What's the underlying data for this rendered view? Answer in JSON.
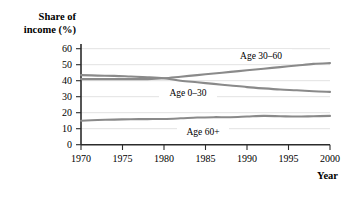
{
  "chart_data": {
    "type": "line",
    "title": "",
    "ylabel": "Share of income (%)",
    "ylabel_line1": "Share of",
    "ylabel_line2": "income (%)",
    "xlabel": "Year",
    "xlim": [
      1970,
      2000
    ],
    "ylim": [
      0,
      60
    ],
    "grid": true,
    "legend_position": "inline-labels",
    "x_ticks": [
      "1970",
      "1975",
      "1980",
      "1985",
      "1990",
      "1995",
      "2000"
    ],
    "x_tick_values": [
      1970,
      1975,
      1980,
      1985,
      1990,
      1995,
      2000
    ],
    "y_ticks": [
      "0",
      "10",
      "20",
      "30",
      "40",
      "50",
      "60"
    ],
    "y_tick_values": [
      0,
      10,
      20,
      30,
      40,
      50,
      60
    ],
    "x": [
      1970,
      1972,
      1974,
      1976,
      1978,
      1980,
      1982,
      1984,
      1986,
      1988,
      1990,
      1992,
      1994,
      1996,
      1998,
      2000
    ],
    "series": [
      {
        "name": "Age 30–60",
        "label": "Age 30–60",
        "color": "#8a8a8a",
        "values": [
          41.0,
          41.0,
          41.0,
          41.0,
          41.0,
          41.5,
          42.5,
          43.5,
          44.5,
          45.5,
          46.5,
          47.5,
          48.5,
          49.5,
          50.5,
          51.0
        ]
      },
      {
        "name": "Age 0–30",
        "label": "Age 0–30",
        "color": "#8a8a8a",
        "values": [
          43.5,
          43.2,
          43.0,
          42.6,
          42.2,
          41.5,
          40.0,
          39.0,
          38.0,
          37.0,
          36.0,
          35.2,
          34.5,
          34.0,
          33.4,
          33.0
        ]
      },
      {
        "name": "Age 60+",
        "label": "Age 60+",
        "color": "#8a8a8a",
        "values": [
          15.0,
          15.4,
          15.7,
          15.9,
          16.0,
          16.1,
          16.5,
          17.0,
          17.2,
          17.2,
          17.6,
          18.0,
          17.8,
          17.6,
          17.8,
          18.0
        ]
      }
    ],
    "annotations": [
      {
        "text": "Age 30–60",
        "x": 1988,
        "y": 54
      },
      {
        "text": "Age 0–30",
        "x": 1982.5,
        "y": 35.5
      },
      {
        "text": "Age 60+",
        "x": 1985,
        "y": 12.5
      }
    ]
  }
}
